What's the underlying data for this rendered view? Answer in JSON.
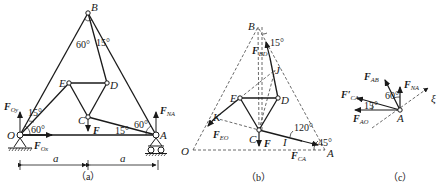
{
  "figure": {
    "panels": [
      {
        "caption": "（a）",
        "points": {
          "O": "O",
          "A": "A",
          "B": "B",
          "C": "C",
          "D": "D",
          "E": "E"
        },
        "angles": {
          "at_B_left": "60°",
          "at_B_right": "15°",
          "at_O_upper": "15°",
          "at_O_lower": "60°",
          "at_A_upper": "60°",
          "at_A_lower": "15°"
        },
        "forces": {
          "FOy": {
            "main": "F",
            "sub": "Oy"
          },
          "FOx": {
            "main": "F",
            "sub": "Ox"
          },
          "FNA": {
            "main": "F",
            "sub": "NA"
          },
          "F": {
            "main": "F",
            "sub": ""
          }
        },
        "dimensions": {
          "left": "a",
          "right": "a"
        }
      },
      {
        "caption": "（b）",
        "points": {
          "O": "O",
          "A": "A",
          "B": "B",
          "C": "C",
          "D": "D",
          "E": "E",
          "K": "K",
          "J": "J",
          "I": "I"
        },
        "angles": {
          "at_B": "15°",
          "at_I": "120°",
          "at_A": "45°"
        },
        "forces": {
          "FBD": {
            "main": "F",
            "sub": "BD"
          },
          "FEO": {
            "main": "F",
            "sub": "EO"
          },
          "FCA": {
            "main": "F",
            "sub": "CA"
          },
          "F": {
            "main": "F",
            "sub": ""
          }
        }
      },
      {
        "caption": "（c）",
        "points": {
          "A": "A"
        },
        "angles": {
          "upper": "60°",
          "lower": "15°"
        },
        "forces": {
          "FAB": {
            "main": "F",
            "sub": "AB"
          },
          "FNA": {
            "main": "F",
            "sub": "NA"
          },
          "FCA_prime": {
            "main": "F′",
            "sub": "CA"
          },
          "FAO": {
            "main": "F",
            "sub": "AO"
          }
        },
        "axis": "ξ"
      }
    ]
  }
}
